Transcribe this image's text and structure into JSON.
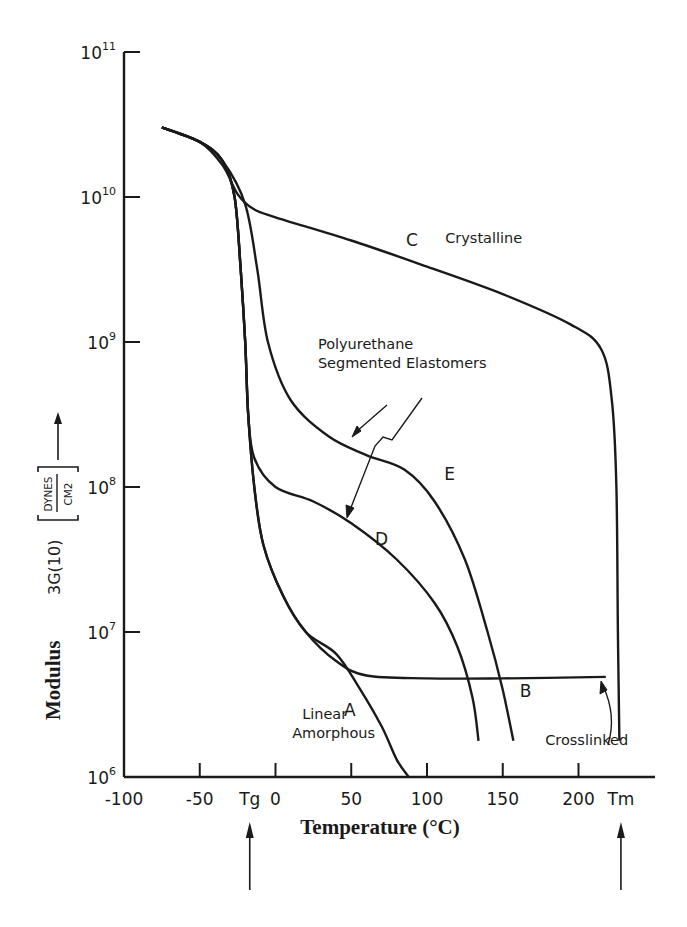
{
  "chart_data": {
    "type": "line",
    "title": "",
    "xlabel": "Temperature (°C)",
    "ylabel": "Modulus 3G(10) [DYNES/CM2]",
    "ylabel_parts": {
      "main": "Modulus",
      "expr": "3G(10)",
      "unit_num": "DYNES",
      "unit_den": "CM2"
    },
    "yscale": "log",
    "xlim": [
      -100,
      240
    ],
    "ylim": [
      1000000.0,
      100000000000.0
    ],
    "x_ticks": [
      -100,
      -50,
      0,
      50,
      100,
      150,
      200
    ],
    "x_tick_labels": [
      "-100",
      "-50",
      "0",
      "50",
      "100",
      "150",
      "200"
    ],
    "x_markers": [
      {
        "label": "Tg",
        "x": -17
      },
      {
        "label": "Tm",
        "x": 228
      }
    ],
    "y_ticks": [
      {
        "base": "10",
        "exp": "11",
        "log": 11
      },
      {
        "base": "10",
        "exp": "10",
        "log": 10
      },
      {
        "base": "10",
        "exp": "9",
        "log": 9
      },
      {
        "base": "10",
        "exp": "8",
        "log": 8
      },
      {
        "base": "10",
        "exp": "7",
        "log": 7
      },
      {
        "base": "10",
        "exp": "6",
        "log": 6
      }
    ],
    "grid": false,
    "legend": "none (curves labeled directly)",
    "series": [
      {
        "name": "A",
        "description": "Linear Amorphous",
        "points": [
          [
            -75,
            10.48
          ],
          [
            -50,
            10.38
          ],
          [
            -35,
            10.25
          ],
          [
            -27,
            10.0
          ],
          [
            -23,
            9.5
          ],
          [
            -20,
            9.0
          ],
          [
            -18,
            8.5
          ],
          [
            -14,
            8.0
          ],
          [
            -8,
            7.6
          ],
          [
            5,
            7.25
          ],
          [
            20,
            7.0
          ],
          [
            40,
            6.85
          ],
          [
            55,
            6.62
          ],
          [
            70,
            6.35
          ],
          [
            80,
            6.12
          ],
          [
            88,
            6.0
          ]
        ]
      },
      {
        "name": "B",
        "description": "Crosslinked",
        "points": [
          [
            -75,
            10.48
          ],
          [
            -50,
            10.38
          ],
          [
            -35,
            10.25
          ],
          [
            -27,
            10.0
          ],
          [
            -23,
            9.5
          ],
          [
            -20,
            9.0
          ],
          [
            -18,
            8.5
          ],
          [
            -14,
            8.0
          ],
          [
            -8,
            7.6
          ],
          [
            5,
            7.25
          ],
          [
            20,
            7.0
          ],
          [
            40,
            6.8
          ],
          [
            60,
            6.7
          ],
          [
            100,
            6.68
          ],
          [
            150,
            6.68
          ],
          [
            218,
            6.69
          ]
        ]
      },
      {
        "name": "C",
        "description": "Crystalline",
        "points": [
          [
            -75,
            10.48
          ],
          [
            -50,
            10.38
          ],
          [
            -35,
            10.22
          ],
          [
            -25,
            10.02
          ],
          [
            -15,
            9.92
          ],
          [
            0,
            9.86
          ],
          [
            50,
            9.7
          ],
          [
            100,
            9.52
          ],
          [
            150,
            9.33
          ],
          [
            195,
            9.12
          ],
          [
            215,
            8.95
          ],
          [
            222,
            8.6
          ],
          [
            225,
            8.0
          ],
          [
            226,
            7.0
          ],
          [
            227,
            6.25
          ]
        ]
      },
      {
        "name": "D",
        "description": "Polyurethane Segmented Elastomer",
        "points": [
          [
            -75,
            10.48
          ],
          [
            -50,
            10.38
          ],
          [
            -35,
            10.25
          ],
          [
            -27,
            10.0
          ],
          [
            -23,
            9.5
          ],
          [
            -20,
            9.0
          ],
          [
            -18,
            8.5
          ],
          [
            -14,
            8.2
          ],
          [
            0,
            8.0
          ],
          [
            25,
            7.9
          ],
          [
            50,
            7.75
          ],
          [
            80,
            7.5
          ],
          [
            105,
            7.2
          ],
          [
            120,
            6.9
          ],
          [
            130,
            6.55
          ],
          [
            134,
            6.25
          ]
        ]
      },
      {
        "name": "E",
        "description": "Polyurethane Segmented Elastomer",
        "points": [
          [
            -75,
            10.48
          ],
          [
            -50,
            10.38
          ],
          [
            -35,
            10.25
          ],
          [
            -20,
            9.95
          ],
          [
            -12,
            9.5
          ],
          [
            -5,
            9.0
          ],
          [
            10,
            8.6
          ],
          [
            35,
            8.35
          ],
          [
            60,
            8.22
          ],
          [
            85,
            8.12
          ],
          [
            105,
            7.9
          ],
          [
            125,
            7.5
          ],
          [
            140,
            7.0
          ],
          [
            150,
            6.6
          ],
          [
            157,
            6.25
          ]
        ]
      }
    ],
    "curve_labels": [
      {
        "text": "A",
        "x": 49,
        "log": 6.42
      },
      {
        "text": "B",
        "x": 165,
        "log": 6.55
      },
      {
        "text": "C",
        "x": 90,
        "log": 9.66
      },
      {
        "text": "D",
        "x": 70,
        "log": 7.6
      },
      {
        "text": "E",
        "x": 115,
        "log": 8.05
      }
    ],
    "annotations": [
      {
        "text": "Crystalline",
        "x": 112,
        "log": 9.68
      },
      {
        "lines": [
          "Polyurethane",
          "Segmented  Elastomers"
        ],
        "x": 28,
        "log": 8.95
      },
      {
        "lines": [
          "Linear",
          "Amorphous"
        ],
        "x": 11,
        "log": 6.4
      },
      {
        "text": "Crosslinked",
        "x": 178,
        "log": 6.22
      }
    ]
  }
}
